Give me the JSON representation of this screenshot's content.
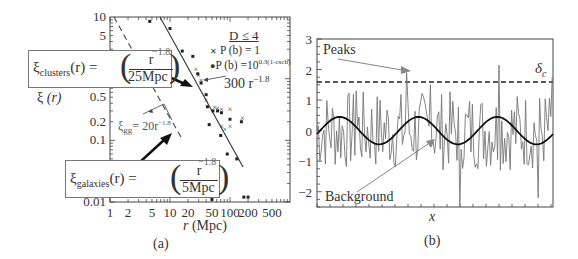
{
  "chart_data": [
    {
      "panel": "(a)",
      "type": "scatter",
      "xscale": "log",
      "yscale": "log",
      "xlabel": "r (Mpc)",
      "ylabel": "ξ (r)",
      "xlim": [
        1,
        1000
      ],
      "ylim": [
        0.01,
        10
      ],
      "x_ticks": [
        "1",
        "2",
        "5",
        "10",
        "20",
        "50",
        "100",
        "200",
        "500"
      ],
      "y_ticks": [
        "10",
        "5",
        "1",
        "0.5",
        "0.2",
        "0.1",
        "0.01"
      ],
      "legend": {
        "title": "D ≤ 4",
        "entries": [
          {
            "marker": "x",
            "label": "P (b) = 1"
          },
          {
            "marker": "•",
            "label": "P (b) =10^{0.3(1-csch)}"
          }
        ]
      },
      "series": [
        {
          "name": "P (b) = 1 (x)",
          "points": [
            [
              27,
              1.45
            ],
            [
              30,
              1.15
            ],
            [
              33,
              0.95
            ],
            [
              40,
              0.45
            ],
            [
              55,
              0.35
            ],
            [
              62,
              0.33
            ],
            [
              72,
              0.32
            ],
            [
              100,
              0.32
            ],
            [
              160,
              0.23
            ],
            [
              72,
              0.17
            ],
            [
              100,
              0.17
            ],
            [
              82,
              0.15
            ]
          ]
        },
        {
          "name": "P (b) = 10^0.3(1-csch) (•)",
          "points": [
            [
              4.6,
              8.5
            ],
            [
              10,
              6.5
            ],
            [
              16,
              2.8
            ],
            [
              24,
              2.3
            ],
            [
              29,
              1.2
            ],
            [
              33,
              0.85
            ],
            [
              40,
              0.55
            ],
            [
              42,
              0.35
            ],
            [
              52,
              0.3
            ],
            [
              62,
              0.3
            ],
            [
              72,
              0.28
            ],
            [
              100,
              0.22
            ],
            [
              155,
              0.2
            ],
            [
              45,
              0.18
            ],
            [
              70,
              0.12
            ],
            [
              90,
              0.06
            ],
            [
              130,
              0.05
            ],
            [
              50,
              0.011
            ],
            [
              170,
              0.012
            ],
            [
              200,
              0.012
            ]
          ]
        }
      ],
      "lines": [
        {
          "label": "300 r^-1.8",
          "style": "solid",
          "x_range": [
            18,
            200
          ]
        },
        {
          "label": "ξgg = 20r^-1.8",
          "style": "dashed",
          "x_range": [
            1.2,
            30
          ]
        }
      ],
      "annotations": [
        "ξclusters(r) = (r/25Mpc)^-1.8",
        "ξgalaxies(r) = (r/5Mpc)^-1.8",
        "300 r^-1.8",
        "ξgg = 20r^-1.8"
      ]
    },
    {
      "panel": "(b)",
      "type": "line",
      "xlabel": "x",
      "ylabel": "",
      "ylim": [
        -2.5,
        3
      ],
      "y_ticks": [
        "3",
        "2",
        "1",
        "0",
        "-1",
        "-2"
      ],
      "threshold": {
        "label": "δc",
        "value": 1.7,
        "style": "dashed"
      },
      "series": [
        {
          "name": "noisy field",
          "description": "high-frequency fluctuating density field, range approx -2.4 to 2.4"
        },
        {
          "name": "background",
          "description": "smooth sinusoid amplitude ~0.45, 3 periods",
          "amplitude": 0.45
        }
      ],
      "annotations": [
        "Peaks",
        "Background",
        "δc"
      ]
    }
  ],
  "panel_a": {
    "caption": "(a)",
    "xlabel_var": "r",
    "xlabel_unit": " (Mpc)",
    "ylabel_var": "ξ",
    "ylabel_arg": "(r)",
    "xticks": [
      "1",
      "2",
      "5",
      "10",
      "20",
      "50",
      "100",
      "200",
      "500"
    ],
    "yticks": [
      "10",
      "5",
      "1",
      "0.5",
      "0.2",
      "0.1",
      "0.01"
    ],
    "legend_title": "D ≤ 4",
    "legend_1": "P (b) = 1",
    "legend_2_base": "P (b) =10",
    "legend_2_exp": "0.3(1-csch)",
    "fit_label_base": "300 r",
    "fit_label_exp": "−1.8",
    "gg_label_sym": "ξ",
    "gg_label_sub": "gg",
    "gg_label_rest": "= 20r",
    "gg_label_exp": "−1.8",
    "clusters_lhs_sym": "ξ",
    "clusters_lhs_sub": "clusters",
    "clusters_lhs_rest": "(r) =",
    "clusters_num": "r",
    "clusters_den": "25Mpc",
    "clusters_exp": "−1.8",
    "galaxies_lhs_sym": "ξ",
    "galaxies_lhs_sub": "galaxies",
    "galaxies_lhs_rest": "(r) =",
    "galaxies_num": "r",
    "galaxies_den": "5Mpc",
    "galaxies_exp": "−1.8"
  },
  "panel_b": {
    "caption": "(b)",
    "xlabel": "x",
    "yticks": [
      "3",
      "2",
      "1",
      "0",
      "−1",
      "−2"
    ],
    "peaks_label": "Peaks",
    "background_label": "Background",
    "delta_sym": "δ",
    "delta_sub": "c"
  }
}
